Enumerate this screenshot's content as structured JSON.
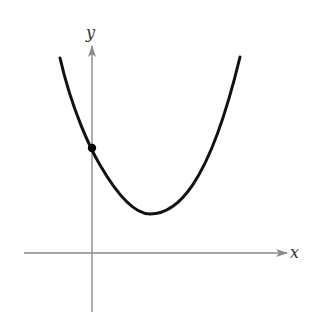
{
  "figure": {
    "type": "parabola-graph",
    "axes": {
      "x_label": "x",
      "y_label": "y",
      "axis_color": "#8a8a8a"
    },
    "curve": {
      "shape": "upward-opening parabola",
      "color": "#111111",
      "vertex_quadrant": "first quadrant (right of y-axis, above x-axis)"
    },
    "points": [
      {
        "label": "",
        "description": "y-intercept",
        "color": "#000000"
      }
    ]
  }
}
